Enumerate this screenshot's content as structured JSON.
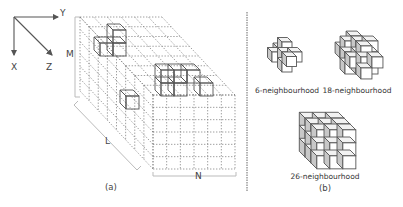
{
  "figure": {
    "panel_a": {
      "caption": "(a)",
      "axes": {
        "x_label": "X",
        "y_label": "Y",
        "z_label": "Z"
      },
      "dimensions": {
        "height_label": "M",
        "depth_label": "L",
        "width_label": "N"
      },
      "description": "3D voxel grid of size M x L x N drawn with dotted lines, containing three highlighted solid voxel groups"
    },
    "panel_b": {
      "caption": "(b)",
      "neighbourhoods": [
        {
          "label": "6-neighbourhood",
          "voxels": 7
        },
        {
          "label": "18-neighbourhood",
          "voxels": 19
        },
        {
          "label": "26-neighbourhood",
          "voxels": 27
        }
      ]
    },
    "colors": {
      "line": "#555555",
      "dotted": "#777777",
      "face_front": "#ffffff",
      "face_side": "#c8c8c8",
      "face_top": "#f2f2f2",
      "divider": "#666666"
    }
  }
}
